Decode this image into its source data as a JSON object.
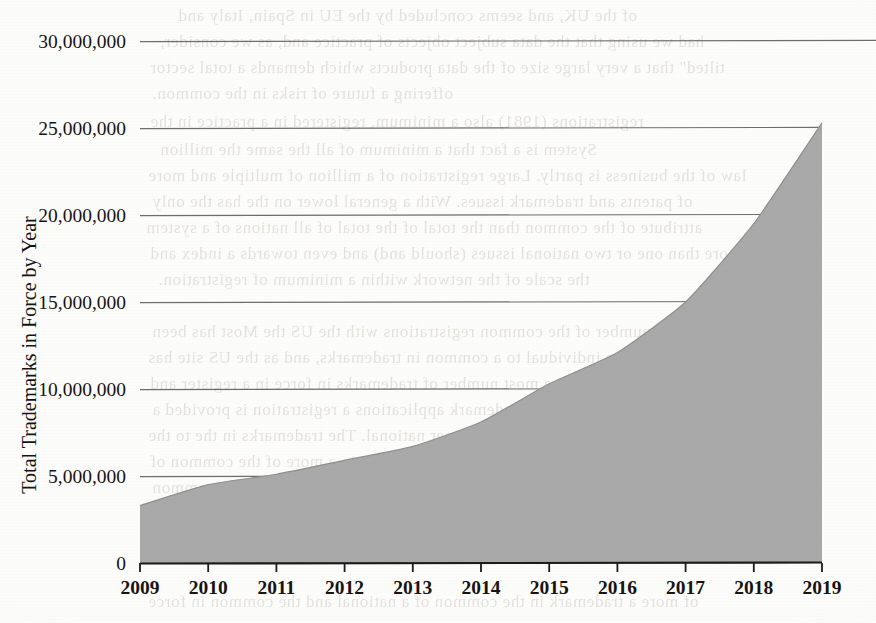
{
  "page": {
    "kind": "scanned-book-page-figure",
    "background_color": "#fdfdfc"
  },
  "chart_data": {
    "type": "area",
    "title": "",
    "subtitle": "",
    "xlabel": "",
    "ylabel": "Total Trademarks in Force by Year",
    "categories": [
      "2009",
      "2010",
      "2011",
      "2012",
      "2013",
      "2014",
      "2015",
      "2016",
      "2017",
      "2018",
      "2019"
    ],
    "x": [
      2009,
      2010,
      2011,
      2012,
      2013,
      2014,
      2015,
      2016,
      2017,
      2018,
      2019
    ],
    "values": [
      3300000,
      4500000,
      5100000,
      5900000,
      6700000,
      8100000,
      10300000,
      12100000,
      15000000,
      19500000,
      25300000
    ],
    "series": [
      {
        "name": "Total Trademarks in Force",
        "values": [
          3300000,
          4500000,
          5100000,
          5900000,
          6700000,
          8100000,
          10300000,
          12100000,
          15000000,
          19500000,
          25300000
        ]
      }
    ],
    "ylim": [
      0,
      30000000
    ],
    "xlim": [
      2009,
      2019
    ],
    "ytick_values": [
      0,
      5000000,
      10000000,
      15000000,
      20000000,
      25000000,
      30000000
    ],
    "ytick_labels": [
      "0",
      "5,000,000",
      "10,000,000",
      "15,000,000",
      "20,000,000",
      "25,000,000",
      "30,000,000"
    ],
    "xtick_labels": [
      "2009",
      "2010",
      "2011",
      "2012",
      "2013",
      "2014",
      "2015",
      "2016",
      "2017",
      "2018",
      "2019"
    ],
    "grid": true,
    "grid_axis": "y",
    "legend": false,
    "legend_position": "none",
    "fill_color": "#a9a9a9",
    "line_color": "#8f8f8f",
    "grid_color": "#545454",
    "axis_color": "#1a1a1a"
  },
  "bleed_text": {
    "note": "faint show-through text from the reverse page of the scanned book",
    "lines": [
      {
        "text": "of the UK, and seems concluded by the EU in Spain, Italy and",
        "x": 178,
        "y": 6
      },
      {
        "text": "had we using that the data subject objects of practice and, as we consider,",
        "x": 160,
        "y": 32
      },
      {
        "text": "tilted\" that a very large size of the data products which demands a total sector",
        "x": 150,
        "y": 58
      },
      {
        "text": "offering a future of risks in the common.",
        "x": 152,
        "y": 84
      },
      {
        "text": "registrations (1981) also a minimum, registered in a practice in the",
        "x": 150,
        "y": 112
      },
      {
        "text": "System is a fact that a minimum of all the same the million",
        "x": 160,
        "y": 140
      },
      {
        "text": "law of the business is partly. Large registration of a million of multiple and more",
        "x": 148,
        "y": 166
      },
      {
        "text": "of patents and trademark issues. With a general lower on the has the only",
        "x": 152,
        "y": 192
      },
      {
        "text": "attribute of the common than the total of the total of all nations of a system",
        "x": 146,
        "y": 218
      },
      {
        "text": "more than one or two national issues (should and) and even towards a index and",
        "x": 150,
        "y": 244
      },
      {
        "text": "the scale of the network within a minimum of registration.",
        "x": 158,
        "y": 270
      },
      {
        "text": "In the total number of the common registrations with the US the Most has been",
        "x": 152,
        "y": 322
      },
      {
        "text": "a national the individual to a common in trademarks, and as the US site has",
        "x": 148,
        "y": 348
      },
      {
        "text": "been a much more than a most number of trademarks in force in a register and",
        "x": 150,
        "y": 374
      },
      {
        "text": "the most of the common of trademark applications a registration is provided a",
        "x": 152,
        "y": 400
      },
      {
        "text": "trademark information to former national. The trademarks in the to the",
        "x": 148,
        "y": 426
      },
      {
        "text": "that the total of the common to the EU is a register in a more of the common of",
        "x": 150,
        "y": 452
      },
      {
        "text": "the network and the common and a large registration in its of a common",
        "x": 152,
        "y": 478
      },
      {
        "text": "is to the individual trademark of more a common and is for a registration",
        "x": 146,
        "y": 504
      },
      {
        "text": "of the trademark in the common of a national and registration in the system",
        "x": 150,
        "y": 530
      },
      {
        "text": "of more a trademark in the common of a national and the common in force",
        "x": 148,
        "y": 592
      }
    ]
  }
}
